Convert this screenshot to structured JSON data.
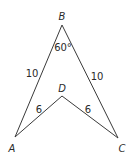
{
  "diagram": {
    "type": "geometry-figure",
    "vertices": {
      "A": {
        "label": "A",
        "x": 15,
        "y": 137
      },
      "B": {
        "label": "B",
        "x": 62,
        "y": 25
      },
      "C": {
        "label": "C",
        "x": 118,
        "y": 138
      },
      "D": {
        "label": "D",
        "x": 62,
        "y": 96
      }
    },
    "edges": [
      {
        "from": "A",
        "to": "B",
        "length_label": "10"
      },
      {
        "from": "B",
        "to": "C",
        "length_label": "10"
      },
      {
        "from": "A",
        "to": "D",
        "length_label": "6"
      },
      {
        "from": "D",
        "to": "C",
        "length_label": "6"
      }
    ],
    "angle": {
      "vertex": "B",
      "label": "60°"
    },
    "labels": {
      "vertex_a": "A",
      "vertex_b": "B",
      "vertex_c": "C",
      "vertex_d": "D",
      "angle_b": "60°",
      "side_ab": "10",
      "side_bc": "10",
      "side_ad": "6",
      "side_dc": "6"
    },
    "colors": {
      "line": "#3a3a3a",
      "text": "#2a2a2a",
      "background": "#ffffff"
    }
  }
}
